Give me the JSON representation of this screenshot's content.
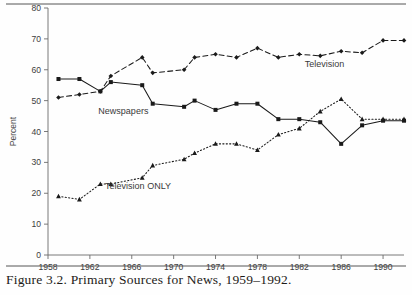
{
  "figure": {
    "caption": "Figure 3.2. Primary Sources for News, 1959–1992.",
    "top_rule": true,
    "bottom_rule": true
  },
  "chart_data": {
    "type": "line",
    "title": "",
    "xlabel": "",
    "ylabel": "Percent",
    "xlim": [
      1958,
      1992
    ],
    "ylim": [
      0,
      80
    ],
    "ytick_step": 10,
    "yticks": [
      0,
      10,
      20,
      30,
      40,
      50,
      60,
      70,
      80
    ],
    "xticks": [
      1958,
      1962,
      1966,
      1970,
      1974,
      1978,
      1982,
      1986,
      1990
    ],
    "xtick_labels": [
      "1958",
      "1962",
      "1966",
      "1970",
      "1974",
      "1978",
      "1982",
      "1986",
      "1990"
    ],
    "ytick_labels": [
      "0",
      "10",
      "20",
      "30",
      "40",
      "50",
      "60",
      "70",
      "80"
    ],
    "grid": false,
    "legend": "inline-annotations",
    "x": [
      1959,
      1961,
      1963,
      1964,
      1967,
      1968,
      1971,
      1972,
      1974,
      1976,
      1978,
      1980,
      1982,
      1984,
      1986,
      1988,
      1990,
      1992
    ],
    "series": [
      {
        "name": "Television",
        "label": "Television",
        "style": "dashed",
        "marker": "diamond",
        "color": "#1a1a1a",
        "label_x": 1984.4,
        "label_y": 61.0,
        "values": [
          51,
          52,
          53,
          58,
          64,
          59,
          60,
          64,
          65,
          64,
          67,
          64,
          65,
          64.5,
          66,
          65.5,
          69.5,
          69.5
        ]
      },
      {
        "name": "Newspapers",
        "label": "Newspapers",
        "style": "solid",
        "marker": "square",
        "color": "#1a1a1a",
        "label_x": 1965.2,
        "label_y": 45.6,
        "values": [
          57,
          57,
          53,
          56,
          55,
          49,
          48,
          50,
          47,
          49,
          49,
          44,
          44,
          43,
          36,
          42,
          43.5,
          43.5
        ]
      },
      {
        "name": "Television ONLY",
        "label": "Television ONLY",
        "style": "dotted",
        "marker": "triangle",
        "color": "#1a1a1a",
        "label_x": 1966.6,
        "label_y": 21.5,
        "values": [
          19,
          18,
          23,
          23,
          25,
          29,
          31,
          33,
          36,
          36,
          34,
          39,
          41,
          46.5,
          50.5,
          44,
          44,
          44
        ]
      }
    ]
  }
}
